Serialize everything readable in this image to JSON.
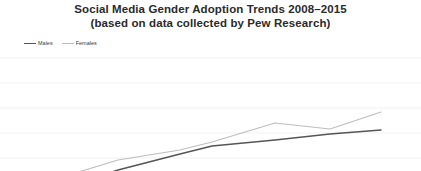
{
  "chart_data": {
    "type": "line",
    "title": "Social Media Gender Adoption Trends 2008–2015",
    "subtitle": "(based on data collected by  Pew Research)",
    "xlabel": "",
    "ylabel": "",
    "grid": true,
    "legend_position": "top-left",
    "x": [
      2008,
      2009,
      2010,
      2011,
      2012,
      2013,
      2014,
      2015
    ],
    "xlim": [
      2008,
      2015
    ],
    "ylim": [
      0,
      80
    ],
    "yticks": [
      0,
      10,
      20,
      30,
      40,
      50,
      60,
      70,
      80
    ],
    "series": [
      {
        "name": "Males",
        "color": "#555555",
        "values": [
          5,
          22,
          33,
          41,
          46,
          53,
          62,
          64
        ]
      },
      {
        "name": "Females",
        "color": "#bdbdbd",
        "values": [
          6,
          27,
          40,
          46,
          54,
          64,
          61,
          70
        ]
      }
    ]
  },
  "legend": {
    "items": [
      {
        "label": "Males",
        "color": "#555555"
      },
      {
        "label": "Females",
        "color": "#bdbdbd"
      }
    ]
  },
  "colors": {
    "background": "#ffffff",
    "title_text": "#2b2b2b",
    "gridline": "#ededed",
    "males_line": "#555555",
    "females_line": "#bdbdbd"
  },
  "geometry": {
    "gridlines_y": [
      8,
      33,
      58,
      83,
      108
    ],
    "males_points": "20,175 72,135 118,120 180,104 212,96 275,90 330,84 381,80",
    "females_points": "20,172 72,124 118,110 180,100 212,92 275,73 330,79 381,62"
  }
}
